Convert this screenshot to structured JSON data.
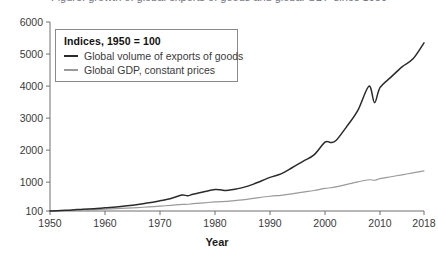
{
  "figure": {
    "cut_off_caption": "Figure: growth of global exports of goods and global GDP since 1950",
    "legend": {
      "title": "Indices, 1950 = 100",
      "entries": [
        {
          "label": "Global volume of exports of goods",
          "color": "#2b2b2b",
          "swatch": "line-swatch-exports"
        },
        {
          "label": "Global GDP, constant prices",
          "color": "#9a9a9a",
          "swatch": "line-swatch-gdp"
        }
      ]
    }
  },
  "chart_data": {
    "type": "line",
    "title": "",
    "xlabel": "Year",
    "ylabel": "",
    "xlim": [
      1950,
      2018
    ],
    "ylim": [
      100,
      6000
    ],
    "grid": false,
    "legend_position": "top-left",
    "xticks": [
      "1950",
      "1960",
      "1970",
      "1980",
      "1990",
      "2000",
      "2010",
      "2018"
    ],
    "xtick_values": [
      1950,
      1960,
      1970,
      1980,
      1990,
      2000,
      2010,
      2018
    ],
    "yticks": [
      "100",
      "1000",
      "2000",
      "3000",
      "4000",
      "5000",
      "6000"
    ],
    "ytick_values": [
      100,
      1000,
      2000,
      3000,
      4000,
      5000,
      6000
    ],
    "x": [
      1950,
      1952,
      1954,
      1956,
      1958,
      1960,
      1962,
      1964,
      1966,
      1968,
      1970,
      1972,
      1974,
      1975,
      1976,
      1978,
      1980,
      1981,
      1982,
      1983,
      1985,
      1987,
      1990,
      1992,
      1994,
      1996,
      1998,
      2000,
      2001,
      2002,
      2004,
      2006,
      2008,
      2009,
      2010,
      2012,
      2014,
      2016,
      2018
    ],
    "series": [
      {
        "name": "Global volume of exports of goods",
        "color": "#2b2b2b",
        "values": [
          100,
          118,
          134,
          158,
          170,
          200,
          225,
          262,
          305,
          355,
          420,
          490,
          600,
          575,
          620,
          700,
          770,
          760,
          740,
          760,
          830,
          940,
          1150,
          1260,
          1450,
          1650,
          1850,
          2250,
          2240,
          2300,
          2750,
          3250,
          4000,
          3480,
          3950,
          4280,
          4600,
          4850,
          5350
        ]
      },
      {
        "name": "Global GDP, constant prices",
        "color": "#9a9a9a",
        "values": [
          100,
          110,
          120,
          132,
          142,
          158,
          172,
          190,
          208,
          228,
          252,
          278,
          305,
          310,
          328,
          355,
          382,
          392,
          398,
          415,
          450,
          495,
          560,
          590,
          635,
          690,
          740,
          805,
          825,
          855,
          930,
          1010,
          1075,
          1060,
          1110,
          1170,
          1230,
          1290,
          1355
        ]
      }
    ]
  }
}
